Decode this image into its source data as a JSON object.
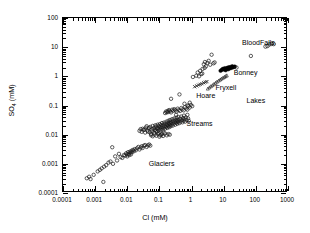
{
  "chart_data": {
    "type": "scatter",
    "title": "",
    "xlabel": "Cl (mM)",
    "ylabel": "SO4 (mM)",
    "ylabel_base": "SO",
    "ylabel_sub": "4",
    "ylabel_unit": " (mM)",
    "xscale": "log",
    "yscale": "log",
    "xlim": [
      0.0001,
      1000
    ],
    "ylim": [
      0.0001,
      100
    ],
    "grid": false,
    "legend": "none",
    "xticks": [
      0.0001,
      0.001,
      0.01,
      0.1,
      1,
      10,
      100,
      1000
    ],
    "xticklabels": [
      "0.0001",
      "0.001",
      "0.01",
      "0.1",
      "1",
      "10",
      "100",
      "1000"
    ],
    "yticks": [
      0.0001,
      0.001,
      0.01,
      0.1,
      1,
      10,
      100
    ],
    "yticklabels": [
      "0.0001",
      "0.001",
      "0.01",
      "0.1",
      "1",
      "10",
      "100"
    ],
    "annotations": [
      {
        "text": "BloodFalls",
        "x": 40,
        "y": 13,
        "name": "annotation-bloodfalls"
      },
      {
        "text": "Bonney",
        "x": 22,
        "y": 1.25,
        "name": "annotation-bonney"
      },
      {
        "text": "Fryxell",
        "x": 6.0,
        "y": 0.36,
        "name": "annotation-fryxell"
      },
      {
        "text": "Hoare",
        "x": 1.5,
        "y": 0.2,
        "name": "annotation-hoare"
      },
      {
        "text": "Lakes",
        "x": 55,
        "y": 0.13,
        "name": "annotation-lakes"
      },
      {
        "text": "Streams",
        "x": 0.75,
        "y": 0.022,
        "name": "annotation-streams"
      },
      {
        "text": "Glaciers",
        "x": 0.05,
        "y": 0.0009,
        "name": "annotation-glaciers"
      }
    ],
    "series": [
      {
        "name": "Glaciers",
        "marker": "open-circle",
        "color": "#1a1a1a",
        "size": 3.4,
        "points": [
          [
            0.00055,
            0.00032
          ],
          [
            0.00065,
            0.00036
          ],
          [
            0.00072,
            0.0003
          ],
          [
            0.0009,
            0.00042
          ],
          [
            0.0012,
            0.00055
          ],
          [
            0.0014,
            0.00062
          ],
          [
            0.0016,
            0.0007
          ],
          [
            0.0018,
            0.00024
          ],
          [
            0.0019,
            0.0008
          ],
          [
            0.0022,
            0.0009
          ],
          [
            0.0026,
            0.0011
          ],
          [
            0.003,
            0.0012
          ],
          [
            0.0034,
            0.0037
          ],
          [
            0.0036,
            0.001
          ],
          [
            0.0042,
            0.0018
          ],
          [
            0.0048,
            0.0013
          ],
          [
            0.0055,
            0.0022
          ],
          [
            0.0062,
            0.0017
          ],
          [
            0.007,
            0.0016
          ],
          [
            0.0078,
            0.002
          ],
          [
            0.0085,
            0.0019
          ],
          [
            0.0092,
            0.0023
          ],
          [
            0.0098,
            0.0021
          ],
          [
            0.01,
            0.0018
          ],
          [
            0.0105,
            0.0025
          ],
          [
            0.011,
            0.0022
          ],
          [
            0.0115,
            0.002
          ],
          [
            0.012,
            0.0026
          ],
          [
            0.0125,
            0.0024
          ],
          [
            0.013,
            0.0021
          ],
          [
            0.0135,
            0.0028
          ],
          [
            0.014,
            0.0025
          ],
          [
            0.015,
            0.003
          ],
          [
            0.016,
            0.0027
          ],
          [
            0.017,
            0.0032
          ],
          [
            0.0185,
            0.0029
          ],
          [
            0.02,
            0.0034
          ],
          [
            0.022,
            0.0038
          ],
          [
            0.024,
            0.0031
          ],
          [
            0.026,
            0.0036
          ],
          [
            0.028,
            0.004
          ],
          [
            0.03,
            0.0035
          ],
          [
            0.033,
            0.0042
          ],
          [
            0.036,
            0.0044
          ],
          [
            0.04,
            0.0038
          ],
          [
            0.044,
            0.0043
          ],
          [
            0.048,
            0.0046
          ],
          [
            0.052,
            0.0042
          ]
        ]
      },
      {
        "name": "Streams",
        "marker": "open-circle",
        "color": "#1a1a1a",
        "size": 3.4,
        "points": [
          [
            0.03,
            0.016
          ],
          [
            0.034,
            0.015
          ],
          [
            0.038,
            0.0175
          ],
          [
            0.042,
            0.014
          ],
          [
            0.046,
            0.0165
          ],
          [
            0.05,
            0.012
          ],
          [
            0.052,
            0.0185
          ],
          [
            0.055,
            0.0105
          ],
          [
            0.058,
            0.015
          ],
          [
            0.06,
            0.013
          ],
          [
            0.062,
            0.02
          ],
          [
            0.065,
            0.016
          ],
          [
            0.068,
            0.0115
          ],
          [
            0.07,
            0.0175
          ],
          [
            0.072,
            0.0145
          ],
          [
            0.075,
            0.021
          ],
          [
            0.078,
            0.0135
          ],
          [
            0.08,
            0.019
          ],
          [
            0.082,
            0.016
          ],
          [
            0.085,
            0.0125
          ],
          [
            0.088,
            0.022
          ],
          [
            0.09,
            0.017
          ],
          [
            0.093,
            0.014
          ],
          [
            0.096,
            0.02
          ],
          [
            0.1,
            0.0155
          ],
          [
            0.103,
            0.023
          ],
          [
            0.106,
            0.018
          ],
          [
            0.11,
            0.0145
          ],
          [
            0.113,
            0.021
          ],
          [
            0.116,
            0.0165
          ],
          [
            0.12,
            0.025
          ],
          [
            0.124,
            0.019
          ],
          [
            0.128,
            0.015
          ],
          [
            0.132,
            0.022
          ],
          [
            0.136,
            0.0175
          ],
          [
            0.14,
            0.026
          ],
          [
            0.145,
            0.02
          ],
          [
            0.15,
            0.016
          ],
          [
            0.155,
            0.0235
          ],
          [
            0.16,
            0.0185
          ],
          [
            0.165,
            0.028
          ],
          [
            0.17,
            0.0215
          ],
          [
            0.175,
            0.017
          ],
          [
            0.18,
            0.025
          ],
          [
            0.185,
            0.0195
          ],
          [
            0.19,
            0.03
          ],
          [
            0.196,
            0.023
          ],
          [
            0.2,
            0.018
          ],
          [
            0.205,
            0.0265
          ],
          [
            0.21,
            0.021
          ],
          [
            0.215,
            0.032
          ],
          [
            0.22,
            0.0245
          ],
          [
            0.225,
            0.0195
          ],
          [
            0.23,
            0.028
          ],
          [
            0.24,
            0.0225
          ],
          [
            0.25,
            0.034
          ],
          [
            0.255,
            0.026
          ],
          [
            0.26,
            0.0205
          ],
          [
            0.27,
            0.03
          ],
          [
            0.28,
            0.024
          ],
          [
            0.29,
            0.036
          ],
          [
            0.3,
            0.0275
          ],
          [
            0.31,
            0.022
          ],
          [
            0.32,
            0.0315
          ],
          [
            0.33,
            0.0255
          ],
          [
            0.34,
            0.038
          ],
          [
            0.35,
            0.029
          ],
          [
            0.36,
            0.0235
          ],
          [
            0.37,
            0.033
          ],
          [
            0.38,
            0.027
          ],
          [
            0.39,
            0.04
          ],
          [
            0.4,
            0.0305
          ],
          [
            0.42,
            0.025
          ],
          [
            0.44,
            0.035
          ],
          [
            0.46,
            0.0285
          ],
          [
            0.48,
            0.042
          ],
          [
            0.5,
            0.032
          ],
          [
            0.52,
            0.0265
          ],
          [
            0.54,
            0.037
          ],
          [
            0.56,
            0.03
          ],
          [
            0.58,
            0.045
          ],
          [
            0.6,
            0.034
          ],
          [
            0.63,
            0.028
          ],
          [
            0.66,
            0.039
          ],
          [
            0.7,
            0.032
          ],
          [
            0.74,
            0.048
          ],
          [
            0.78,
            0.036
          ],
          [
            0.82,
            0.03
          ],
          [
            0.055,
            0.0095
          ],
          [
            0.062,
            0.0088
          ],
          [
            0.07,
            0.01
          ],
          [
            0.08,
            0.0092
          ],
          [
            0.09,
            0.0105
          ],
          [
            0.1,
            0.0085
          ],
          [
            0.115,
            0.0098
          ],
          [
            0.13,
            0.009
          ],
          [
            0.15,
            0.011
          ],
          [
            0.17,
            0.0095
          ],
          [
            0.19,
            0.0105
          ],
          [
            0.21,
            0.01
          ],
          [
            0.024,
            0.0135
          ],
          [
            0.026,
            0.0155
          ],
          [
            0.028,
            0.0125
          ],
          [
            0.032,
            0.0145
          ],
          [
            0.036,
            0.0118
          ],
          [
            0.04,
            0.0195
          ],
          [
            0.044,
            0.0128
          ],
          [
            0.048,
            0.0172
          ],
          [
            0.15,
            0.055
          ],
          [
            0.16,
            0.062
          ],
          [
            0.17,
            0.058
          ],
          [
            0.18,
            0.065
          ],
          [
            0.19,
            0.06
          ],
          [
            0.2,
            0.07
          ],
          [
            0.215,
            0.064
          ],
          [
            0.23,
            0.058
          ],
          [
            0.25,
            0.072
          ],
          [
            0.27,
            0.066
          ],
          [
            0.29,
            0.075
          ],
          [
            0.31,
            0.069
          ],
          [
            0.34,
            0.062
          ],
          [
            0.37,
            0.078
          ],
          [
            0.4,
            0.07
          ],
          [
            0.44,
            0.065
          ],
          [
            0.48,
            0.082
          ],
          [
            0.52,
            0.074
          ],
          [
            0.57,
            0.068
          ],
          [
            0.62,
            0.088
          ],
          [
            0.68,
            0.079
          ],
          [
            0.74,
            0.072
          ],
          [
            0.8,
            0.095
          ],
          [
            0.87,
            0.085
          ],
          [
            0.23,
            0.17
          ],
          [
            0.42,
            0.24
          ],
          [
            0.6,
            0.115
          ],
          [
            0.76,
            0.1
          ],
          [
            0.88,
            0.125
          ],
          [
            0.95,
            0.105
          ],
          [
            1.05,
            0.095
          ],
          [
            0.33,
            0.048
          ],
          [
            0.12,
            0.0105
          ],
          [
            0.135,
            0.0118
          ],
          [
            0.105,
            0.0095
          ],
          [
            0.095,
            0.0112
          ]
        ]
      },
      {
        "name": "Lakes-Hoare",
        "marker": "cross",
        "color": "#1a1a1a",
        "size": 3.2,
        "points": [
          [
            1.25,
            0.44
          ],
          [
            1.45,
            0.47
          ],
          [
            1.65,
            0.5
          ],
          [
            1.85,
            0.53
          ],
          [
            2.1,
            0.56
          ],
          [
            2.4,
            0.6
          ],
          [
            2.7,
            0.63
          ],
          [
            3.0,
            0.66
          ]
        ]
      },
      {
        "name": "Lakes-Fryxell",
        "marker": "open-triangle",
        "color": "#1a1a1a",
        "size": 3.0,
        "points": [
          [
            3.2,
            0.38
          ],
          [
            3.6,
            0.42
          ],
          [
            4.0,
            0.46
          ],
          [
            4.5,
            0.5
          ],
          [
            5.0,
            0.55
          ],
          [
            5.6,
            0.6
          ],
          [
            6.2,
            0.66
          ],
          [
            7.0,
            0.72
          ],
          [
            7.8,
            0.78
          ],
          [
            8.6,
            0.84
          ],
          [
            9.5,
            0.9
          ],
          [
            10.5,
            0.96
          ],
          [
            11.5,
            1.02
          ],
          [
            12.5,
            1.08
          ]
        ]
      },
      {
        "name": "Lakes-Bonney",
        "marker": "filled",
        "color": "#000000",
        "size": 3.6,
        "points": [
          [
            8.0,
            1.55
          ],
          [
            8.8,
            1.68
          ],
          [
            9.5,
            1.8
          ],
          [
            10.2,
            1.72
          ],
          [
            10.8,
            1.9
          ],
          [
            11.5,
            1.62
          ],
          [
            12.2,
            1.85
          ],
          [
            13.0,
            1.95
          ],
          [
            13.8,
            1.75
          ],
          [
            14.5,
            2.05
          ],
          [
            15.5,
            1.88
          ],
          [
            16.5,
            2.1
          ],
          [
            17.5,
            1.95
          ],
          [
            18.5,
            2.2
          ],
          [
            20.0,
            2.05
          ],
          [
            22.0,
            2.15
          ]
        ]
      },
      {
        "name": "Lakes-other",
        "marker": "open-circle",
        "color": "#1a1a1a",
        "size": 3.4,
        "points": [
          [
            1.4,
            1.05
          ],
          [
            1.55,
            1.35
          ],
          [
            1.7,
            1.0
          ],
          [
            1.85,
            1.55
          ],
          [
            2.0,
            1.2
          ],
          [
            2.2,
            1.8
          ],
          [
            2.4,
            2.6
          ],
          [
            2.6,
            3.1
          ],
          [
            2.8,
            2.2
          ],
          [
            3.1,
            2.9
          ],
          [
            3.4,
            3.4
          ],
          [
            3.8,
            2.5
          ],
          [
            4.2,
            5.5
          ],
          [
            4.8,
            2.8
          ],
          [
            2.15,
            1.25
          ],
          [
            2.55,
            1.95
          ],
          [
            25.0,
            2.0
          ],
          [
            70.0,
            5.0
          ],
          [
            1.1,
            0.95
          ],
          [
            5.2,
            3.0
          ]
        ]
      },
      {
        "name": "BloodFalls",
        "marker": "open-circle",
        "color": "#1a1a1a",
        "size": 3.6,
        "points": [
          [
            200,
            10.5
          ],
          [
            230,
            11.0
          ],
          [
            265,
            12.5
          ],
          [
            310,
            13.0
          ],
          [
            360,
            12.8
          ]
        ]
      }
    ]
  }
}
